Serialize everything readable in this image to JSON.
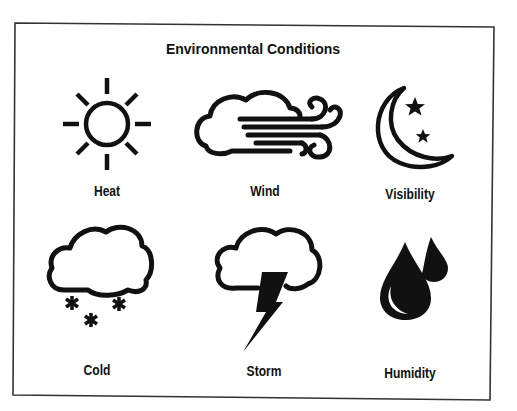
{
  "title": "Environmental Conditions",
  "colors": {
    "ink": "#111111",
    "background": "#ffffff",
    "frame": "#333333"
  },
  "cells": [
    {
      "id": "heat",
      "label": "Heat",
      "icon": "sun-icon"
    },
    {
      "id": "wind",
      "label": "Wind",
      "icon": "wind-cloud-icon"
    },
    {
      "id": "visibility",
      "label": "Visibility",
      "icon": "moon-stars-icon"
    },
    {
      "id": "cold",
      "label": "Cold",
      "icon": "snow-cloud-icon"
    },
    {
      "id": "storm",
      "label": "Storm",
      "icon": "lightning-cloud-icon"
    },
    {
      "id": "humidity",
      "label": "Humidity",
      "icon": "water-drops-icon"
    }
  ]
}
